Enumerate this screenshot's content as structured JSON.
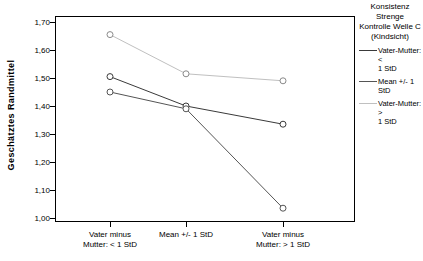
{
  "chart_data": {
    "type": "line",
    "title": "",
    "xlabel": "",
    "ylabel": "Geschätztes Randmittel",
    "categories": [
      "Vater minus Mutter: < 1 StD",
      "Mean +/- 1 StD",
      "Vater minus Mutter: > 1 StD"
    ],
    "category_lines": [
      [
        "Vater minus",
        "Mutter: < 1 StD"
      ],
      [
        "Mean +/- 1 StD",
        ""
      ],
      [
        "Vater minus",
        "Mutter: > 1 StD"
      ]
    ],
    "ylim": [
      1.0,
      1.7
    ],
    "ytick_values": [
      1.7,
      1.6,
      1.5,
      1.4,
      1.3,
      1.2,
      1.1,
      1.0
    ],
    "ytick_labels": [
      "1,70",
      "1,60",
      "1,50",
      "1,40",
      "1,30",
      "1,20",
      "1,10",
      "1,00"
    ],
    "grid": false,
    "legend_position": "right",
    "marker": "open-circle",
    "series": [
      {
        "name": "Vater-Mutter: < 1 StD",
        "color": "#3a3a3a",
        "values": [
          1.505,
          1.4,
          1.335
        ]
      },
      {
        "name": "Mean +/- 1 StD",
        "color": "#555555",
        "values": [
          1.45,
          1.39,
          1.035
        ]
      },
      {
        "name": "Vater-Mutter: > 1 StD",
        "color": "#c0c0c0",
        "values": [
          1.655,
          1.515,
          1.49
        ]
      }
    ]
  },
  "legend": {
    "title_lines": [
      "Konsistenz Strenge",
      "Kontrolle Welle C",
      "(Kindsicht)"
    ],
    "items": [
      {
        "label_lines": [
          "Vater-Mutter: <",
          "1 StD"
        ],
        "color": "#3a3a3a"
      },
      {
        "label_lines": [
          "Mean +/- 1 StD",
          ""
        ],
        "color": "#555555"
      },
      {
        "label_lines": [
          "Vater-Mutter: >",
          "1 StD"
        ],
        "color": "#c0c0c0"
      }
    ]
  }
}
